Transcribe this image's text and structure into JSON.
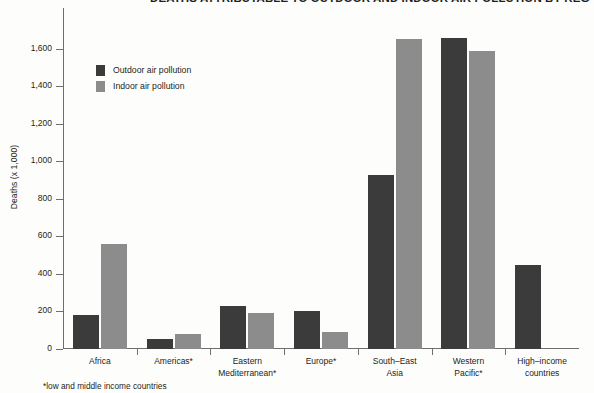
{
  "chart_data": {
    "type": "bar",
    "title": "DEATHS ATTRIBUTABLE TO OUTDOOR AND INDOOR AIR POLLUTION BY REGION (2012)",
    "xlabel": "",
    "ylabel": "Deaths (x 1,000)",
    "ylim": [
      0,
      1700
    ],
    "yticks": [
      0,
      200,
      400,
      600,
      800,
      1000,
      1200,
      1400,
      1600
    ],
    "ytick_labels": [
      "0",
      "200",
      "400",
      "600",
      "800",
      "1,000",
      "1,200",
      "1,400",
      "1,600"
    ],
    "grid": false,
    "legend_position": "upper-left-inside",
    "categories": [
      "Africa",
      "Americas*",
      "Eastern\nMediterranean*",
      "Europe*",
      "South–East\nAsia",
      "Western\nPacific*",
      "High–income\ncountries"
    ],
    "series": [
      {
        "name": "Outdoor air pollution",
        "color": "#3b3b3c",
        "values": [
          180,
          55,
          230,
          200,
          930,
          1660,
          450
        ]
      },
      {
        "name": "Indoor air pollution",
        "color": "#8c8c8c",
        "values": [
          560,
          80,
          190,
          90,
          1650,
          1590,
          0
        ]
      }
    ],
    "annotations": [
      "*low and middle income countries"
    ]
  },
  "footnote": "*low and middle income countries",
  "colors": {
    "outdoor": "#3b3b3c",
    "indoor": "#8c8c8c",
    "axis": "#6e6e6e",
    "text": "#231f20",
    "background": "#fdfdfc"
  }
}
